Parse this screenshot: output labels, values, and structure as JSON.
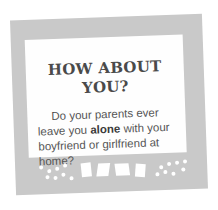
{
  "card": {
    "title_line1": "HOW ABOUT",
    "title_line2": "YOU?",
    "text_before": "Do your parents ever leave you ",
    "text_bold": "alone",
    "text_after": " with your boyfriend or girlfriend at home?"
  },
  "colors": {
    "frame": "#c9c9c9",
    "panel": "#fefefe",
    "text": "#555555"
  }
}
